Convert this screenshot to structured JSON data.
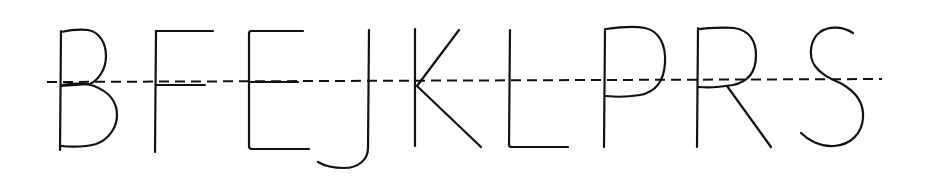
{
  "diagram": {
    "title": "Letters with straight and curved strokes along a dashed midline",
    "letters": [
      "B",
      "F",
      "E",
      "J",
      "K",
      "L",
      "P",
      "R",
      "S"
    ],
    "guide_line": {
      "style": "dashed",
      "color": "#111111"
    },
    "stroke_color": "#111111",
    "background": "#ffffff"
  }
}
